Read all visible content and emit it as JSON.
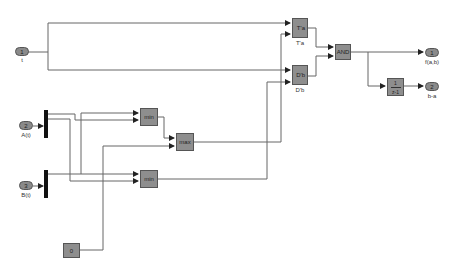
{
  "inports": [
    {
      "id": "in1",
      "number": "1",
      "label": "t"
    },
    {
      "id": "in2",
      "number": "2",
      "label": "A(t)"
    },
    {
      "id": "in3",
      "number": "3",
      "label": "B(t)"
    }
  ],
  "outports": [
    {
      "id": "out1",
      "number": "1",
      "label": "f(a,b)"
    },
    {
      "id": "out2",
      "number": "2",
      "label": "b-a"
    }
  ],
  "blocks": {
    "ta": {
      "text": "T'a",
      "label": "T'a"
    },
    "db": {
      "text": "D'b",
      "label": "D'b"
    },
    "and": {
      "text": "AND"
    },
    "min1": {
      "text": "min"
    },
    "max": {
      "text": "max"
    },
    "min2": {
      "text": "min"
    },
    "const": {
      "text": "0"
    },
    "tf": {
      "num": "1",
      "den": "z-1"
    }
  },
  "colors": {
    "block_fill": "#8e8e8e",
    "wire": "#555555",
    "bus": "#111111",
    "background": "#ffffff"
  }
}
